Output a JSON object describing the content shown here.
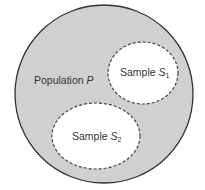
{
  "diagram": {
    "type": "venn",
    "population": {
      "label": "Population",
      "symbol": "P",
      "fill": "#d0d0d0",
      "stroke": "#333333"
    },
    "samples": [
      {
        "label": "Sample",
        "symbol": "S",
        "subscript": "1",
        "fill": "#ffffff",
        "stroke": "#444444",
        "stroke_style": "dashed"
      },
      {
        "label": "Sample",
        "symbol": "S",
        "subscript": "2",
        "fill": "#ffffff",
        "stroke": "#444444",
        "stroke_style": "dashed"
      }
    ]
  }
}
